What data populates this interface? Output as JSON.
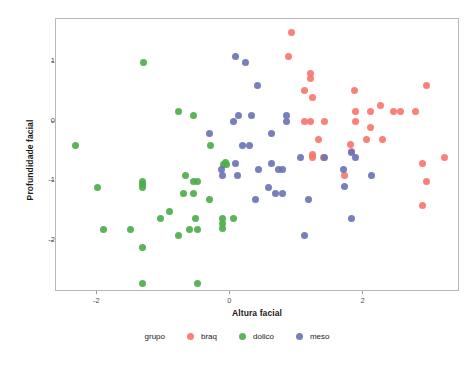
{
  "chart_data": {
    "type": "scatter",
    "title": "",
    "xlabel": "Altura facial",
    "ylabel": "Profundidade facial",
    "xlim": [
      -2.62,
      3.45
    ],
    "ylim": [
      -2.85,
      1.72
    ],
    "xticks": [
      -2,
      0,
      2
    ],
    "yticks": [
      1,
      0,
      -1,
      -2
    ],
    "xticklabels": [
      "-2",
      "0",
      "2"
    ],
    "yticklabels": [
      "1",
      "0",
      "-1",
      "-2"
    ],
    "grid": false,
    "legend_position": "bottom",
    "legend_title": "grupo",
    "series": [
      {
        "name": "braq",
        "color": "#F8766D",
        "points": [
          [
            0.92,
            1.5
          ],
          [
            0.87,
            1.1
          ],
          [
            1.21,
            0.8
          ],
          [
            1.21,
            0.72
          ],
          [
            1.11,
            0.52
          ],
          [
            1.24,
            0.4
          ],
          [
            1.87,
            0.52
          ],
          [
            2.95,
            0.6
          ],
          [
            1.12,
            0.0
          ],
          [
            1.21,
            0.0
          ],
          [
            1.42,
            0.0
          ],
          [
            1.88,
            0.0
          ],
          [
            2.25,
            0.28
          ],
          [
            2.1,
            0.18
          ],
          [
            1.88,
            0.18
          ],
          [
            2.45,
            0.18
          ],
          [
            2.55,
            0.18
          ],
          [
            2.78,
            0.18
          ],
          [
            2.1,
            -0.1
          ],
          [
            1.32,
            -0.3
          ],
          [
            2.05,
            -0.3
          ],
          [
            2.28,
            -0.3
          ],
          [
            1.8,
            -0.38
          ],
          [
            1.82,
            -0.5
          ],
          [
            1.24,
            -0.55
          ],
          [
            1.24,
            -0.6
          ],
          [
            1.4,
            -0.6
          ],
          [
            3.22,
            -0.6
          ],
          [
            2.88,
            -0.7
          ],
          [
            1.72,
            -0.9
          ],
          [
            2.95,
            -1.0
          ],
          [
            2.88,
            -1.4
          ]
        ]
      },
      {
        "name": "dolico",
        "color": "#4DAF4A",
        "points": [
          [
            -1.3,
            1.0
          ],
          [
            -0.78,
            0.18
          ],
          [
            -0.55,
            0.1
          ],
          [
            -0.3,
            -0.4
          ],
          [
            -2.32,
            -0.4
          ],
          [
            -0.1,
            -0.72
          ],
          [
            -0.06,
            -0.72
          ],
          [
            -0.08,
            -0.68
          ],
          [
            -0.68,
            -0.9
          ],
          [
            -1.32,
            -1.0
          ],
          [
            -1.32,
            -1.05
          ],
          [
            -0.56,
            -1.0
          ],
          [
            -0.5,
            -1.0
          ],
          [
            -2.0,
            -1.1
          ],
          [
            -1.32,
            -1.1
          ],
          [
            -0.7,
            -1.2
          ],
          [
            -0.55,
            -1.2
          ],
          [
            -0.32,
            -1.3
          ],
          [
            -0.92,
            -1.5
          ],
          [
            -1.05,
            -1.62
          ],
          [
            -0.52,
            -1.62
          ],
          [
            -0.12,
            -1.62
          ],
          [
            -0.12,
            -1.7
          ],
          [
            -0.12,
            -1.78
          ],
          [
            0.05,
            -1.62
          ],
          [
            -1.9,
            -1.8
          ],
          [
            -1.5,
            -1.8
          ],
          [
            -0.62,
            -1.8
          ],
          [
            -0.5,
            -1.8
          ],
          [
            -0.78,
            -1.9
          ],
          [
            -1.32,
            -2.1
          ],
          [
            -1.32,
            -2.7
          ],
          [
            -0.5,
            -2.7
          ]
        ]
      },
      {
        "name": "meso",
        "color": "#6B74B6",
        "points": [
          [
            0.08,
            1.1
          ],
          [
            0.22,
            1.0
          ],
          [
            0.4,
            0.6
          ],
          [
            0.12,
            0.1
          ],
          [
            0.32,
            0.1
          ],
          [
            0.85,
            0.1
          ],
          [
            0.85,
            0.0
          ],
          [
            0.05,
            0.0
          ],
          [
            -0.32,
            -0.2
          ],
          [
            0.62,
            -0.2
          ],
          [
            0.18,
            -0.4
          ],
          [
            0.28,
            -0.4
          ],
          [
            1.42,
            -0.6
          ],
          [
            1.05,
            -0.6
          ],
          [
            1.88,
            -0.6
          ],
          [
            1.82,
            -0.52
          ],
          [
            0.62,
            -0.7
          ],
          [
            0.08,
            -0.7
          ],
          [
            -0.14,
            -0.8
          ],
          [
            0.42,
            -0.8
          ],
          [
            0.72,
            -0.8
          ],
          [
            0.78,
            -0.8
          ],
          [
            1.7,
            -0.8
          ],
          [
            -0.12,
            -0.9
          ],
          [
            0.1,
            -0.9
          ],
          [
            2.12,
            -0.9
          ],
          [
            1.72,
            -1.08
          ],
          [
            0.58,
            -1.1
          ],
          [
            0.68,
            -1.2
          ],
          [
            0.78,
            -1.2
          ],
          [
            0.38,
            -1.3
          ],
          [
            1.18,
            -1.3
          ],
          [
            1.82,
            -1.62
          ],
          [
            1.12,
            -1.9
          ]
        ]
      }
    ]
  },
  "axes": {
    "x_title": "Altura facial",
    "y_title": "Profundidade facial",
    "x_tick_labels": [
      "-2",
      "0",
      "2"
    ],
    "y_tick_labels": [
      "1",
      "0",
      "-1",
      "-2"
    ]
  },
  "legend": {
    "title": "grupo",
    "items": [
      {
        "label": "braq",
        "color": "#F8766D"
      },
      {
        "label": "dolico",
        "color": "#4DAF4A"
      },
      {
        "label": "meso",
        "color": "#6B74B6"
      }
    ]
  },
  "colors": {
    "background": "#FFFFFF",
    "panel_border": "#B8B8B8",
    "axis_text": "#4D4D4D",
    "title_text": "#1A1A1A"
  }
}
